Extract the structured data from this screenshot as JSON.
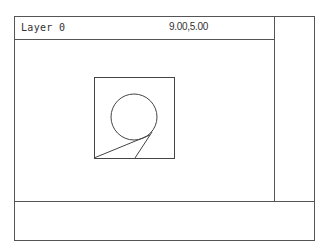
{
  "status_bar": {
    "layer": "Layer 0",
    "coordinates": "9.00,5.00"
  },
  "drawing": {
    "stroke_color": "#444444",
    "entities": [
      {
        "type": "rectangle",
        "x1": 94,
        "y1": 77,
        "x2": 174,
        "y2": 158
      },
      {
        "type": "circle",
        "cx": 134,
        "cy": 117,
        "r": 23
      },
      {
        "type": "line",
        "x1": 94,
        "y1": 158,
        "x2": 150,
        "y2": 135
      },
      {
        "type": "line",
        "x1": 135,
        "y1": 158,
        "x2": 152,
        "y2": 132
      }
    ]
  },
  "side_panel": {},
  "command_area": {
    "text": ""
  }
}
